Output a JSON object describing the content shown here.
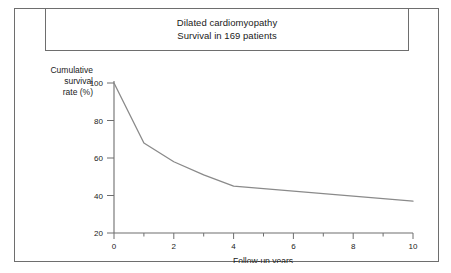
{
  "figure": {
    "title_line1": "Dilated cardiomyopathy",
    "title_line2": "Survival in 169 patients"
  },
  "axes": {
    "y_label_line1": "Cumulative",
    "y_label_line2": "survival",
    "y_label_line3": "rate (%)",
    "x_label": "Follow-up years"
  },
  "chart_data": {
    "type": "line",
    "title": "Dilated cardiomyopathy  Survival in 169 patients",
    "subtitle": "Survival in 169 patients",
    "xlabel": "Follow-up years",
    "ylabel": "Cumulative survival rate (%)",
    "xlim": [
      0,
      10
    ],
    "ylim": [
      20,
      100
    ],
    "xticks": [
      0,
      2,
      4,
      6,
      8,
      10
    ],
    "xminorticks": [
      1,
      3,
      5,
      7,
      9
    ],
    "yticks": [
      20,
      40,
      60,
      80,
      100
    ],
    "xtick_labels": [
      "0",
      "2",
      "4",
      "6",
      "8",
      "10"
    ],
    "ytick_labels": [
      "20",
      "40",
      "60",
      "80",
      "100"
    ],
    "grid": false,
    "legend": false,
    "n_patients": 169,
    "line_color": "#8a8a8a",
    "series": [
      {
        "name": "Cumulative survival",
        "x": [
          0,
          1,
          2,
          3,
          4,
          10
        ],
        "values": [
          100,
          68,
          58,
          51,
          45,
          37
        ]
      }
    ]
  }
}
